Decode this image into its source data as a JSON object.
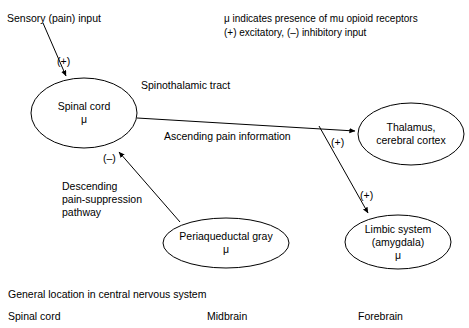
{
  "legend": {
    "line1": "μ indicates presence of mu opioid receptors",
    "line2": "(+) excitatory, (–) inhibitory input"
  },
  "nodes": {
    "spinal_cord": {
      "line1": "Spinal cord",
      "line2": "μ"
    },
    "thalamus": {
      "line1": "Thalamus,",
      "line2": "cerebral cortex"
    },
    "periaqueductal_gray": {
      "line1": "Periaqueductal gray",
      "line2": "μ"
    },
    "limbic_system": {
      "line1": "Limbic system",
      "line2": "(amygdala)",
      "line3": "μ"
    }
  },
  "labels": {
    "sensory_input": "Sensory (pain) input",
    "spinothalamic_tract": "Spinothalamic tract",
    "ascending_pain_information": "Ascending pain information",
    "descending_pathway_line1": "Descending",
    "descending_pathway_line2": "pain-suppression",
    "descending_pathway_line3": "pathway"
  },
  "signs": {
    "sensory_plus": "(+)",
    "descending_minus": "(–)",
    "thalamus_plus": "(+)",
    "limbic_plus": "(+)"
  },
  "footer": {
    "caption": "General location in central nervous system",
    "region_spinal_cord": "Spinal cord",
    "region_midbrain": "Midbrain",
    "region_forebrain": "Forebrain"
  },
  "colors": {
    "stroke": "#000000",
    "background": "#ffffff",
    "text": "#000000"
  }
}
